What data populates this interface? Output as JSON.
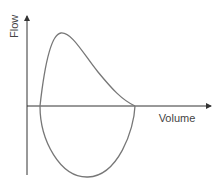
{
  "diagram": {
    "y_axis_label": "Flow",
    "x_axis_label": "Volume",
    "curves": [
      {
        "name": "expiratory-limb",
        "description": "rapid rise to peak flow then near-linear decline to residual volume"
      },
      {
        "name": "inspiratory-limb",
        "description": "symmetric U-shaped curve below the volume axis"
      }
    ],
    "colors": {
      "axis": "#333333",
      "curve": "#777777"
    }
  }
}
